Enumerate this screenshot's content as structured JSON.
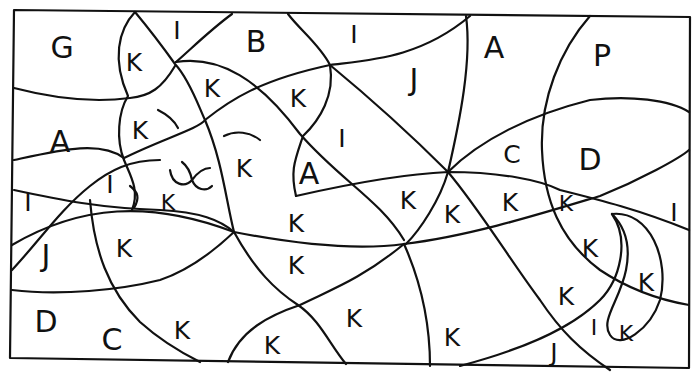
{
  "puzzle": {
    "type": "letter-coded region puzzle",
    "colors": {
      "ink": "#111111",
      "paper": "#ffffff"
    },
    "labels": [
      {
        "id": "l01",
        "text": "G",
        "x": 62,
        "y": 48,
        "size": "big"
      },
      {
        "id": "l02",
        "text": "K",
        "x": 134,
        "y": 62,
        "size": "mid"
      },
      {
        "id": "l03",
        "text": "I",
        "x": 177,
        "y": 30,
        "size": "mid"
      },
      {
        "id": "l04",
        "text": "B",
        "x": 256,
        "y": 42,
        "size": "big"
      },
      {
        "id": "l05",
        "text": "I",
        "x": 354,
        "y": 34,
        "size": "mid"
      },
      {
        "id": "l06",
        "text": "A",
        "x": 494,
        "y": 48,
        "size": "big"
      },
      {
        "id": "l07",
        "text": "P",
        "x": 602,
        "y": 56,
        "size": "big"
      },
      {
        "id": "l08",
        "text": "K",
        "x": 212,
        "y": 88,
        "size": "mid"
      },
      {
        "id": "l09",
        "text": "K",
        "x": 298,
        "y": 98,
        "size": "mid"
      },
      {
        "id": "l10",
        "text": "J",
        "x": 414,
        "y": 80,
        "size": "big"
      },
      {
        "id": "l11",
        "text": "A",
        "x": 60,
        "y": 142,
        "size": "big"
      },
      {
        "id": "l12",
        "text": "K",
        "x": 140,
        "y": 130,
        "size": "mid"
      },
      {
        "id": "l13",
        "text": "I",
        "x": 342,
        "y": 138,
        "size": "mid"
      },
      {
        "id": "l14",
        "text": "K",
        "x": 244,
        "y": 168,
        "size": "mid"
      },
      {
        "id": "l15",
        "text": "A",
        "x": 309,
        "y": 174,
        "size": "big"
      },
      {
        "id": "l16",
        "text": "C",
        "x": 512,
        "y": 154,
        "size": "mid"
      },
      {
        "id": "l17",
        "text": "D",
        "x": 590,
        "y": 160,
        "size": "big"
      },
      {
        "id": "l18",
        "text": "I",
        "x": 28,
        "y": 202,
        "size": "mid"
      },
      {
        "id": "l19",
        "text": "I",
        "x": 110,
        "y": 184,
        "size": "mid"
      },
      {
        "id": "l20",
        "text": "K",
        "x": 168,
        "y": 203,
        "size": "sm"
      },
      {
        "id": "l21",
        "text": "K",
        "x": 296,
        "y": 223,
        "size": "mid"
      },
      {
        "id": "l22",
        "text": "K",
        "x": 408,
        "y": 200,
        "size": "mid"
      },
      {
        "id": "l23",
        "text": "K",
        "x": 452,
        "y": 214,
        "size": "mid"
      },
      {
        "id": "l24",
        "text": "K",
        "x": 510,
        "y": 202,
        "size": "mid"
      },
      {
        "id": "l25",
        "text": "K",
        "x": 566,
        "y": 204,
        "size": "sm"
      },
      {
        "id": "l26",
        "text": "I",
        "x": 674,
        "y": 212,
        "size": "mid"
      },
      {
        "id": "l27",
        "text": "J",
        "x": 46,
        "y": 256,
        "size": "big"
      },
      {
        "id": "l28",
        "text": "K",
        "x": 124,
        "y": 248,
        "size": "mid"
      },
      {
        "id": "l29",
        "text": "K",
        "x": 296,
        "y": 265,
        "size": "mid"
      },
      {
        "id": "l30",
        "text": "K",
        "x": 590,
        "y": 248,
        "size": "mid"
      },
      {
        "id": "l31",
        "text": "K",
        "x": 646,
        "y": 282,
        "size": "mid"
      },
      {
        "id": "l32",
        "text": "D",
        "x": 46,
        "y": 322,
        "size": "big"
      },
      {
        "id": "l33",
        "text": "C",
        "x": 112,
        "y": 340,
        "size": "big"
      },
      {
        "id": "l34",
        "text": "K",
        "x": 182,
        "y": 330,
        "size": "mid"
      },
      {
        "id": "l35",
        "text": "K",
        "x": 354,
        "y": 318,
        "size": "mid"
      },
      {
        "id": "l36",
        "text": "K",
        "x": 272,
        "y": 345,
        "size": "mid"
      },
      {
        "id": "l37",
        "text": "K",
        "x": 452,
        "y": 337,
        "size": "mid"
      },
      {
        "id": "l38",
        "text": "K",
        "x": 566,
        "y": 296,
        "size": "mid"
      },
      {
        "id": "l39",
        "text": "I",
        "x": 594,
        "y": 328,
        "size": "sm"
      },
      {
        "id": "l40",
        "text": "K",
        "x": 626,
        "y": 334,
        "size": "sm"
      },
      {
        "id": "l41",
        "text": "J",
        "x": 554,
        "y": 352,
        "size": "mid"
      }
    ]
  }
}
